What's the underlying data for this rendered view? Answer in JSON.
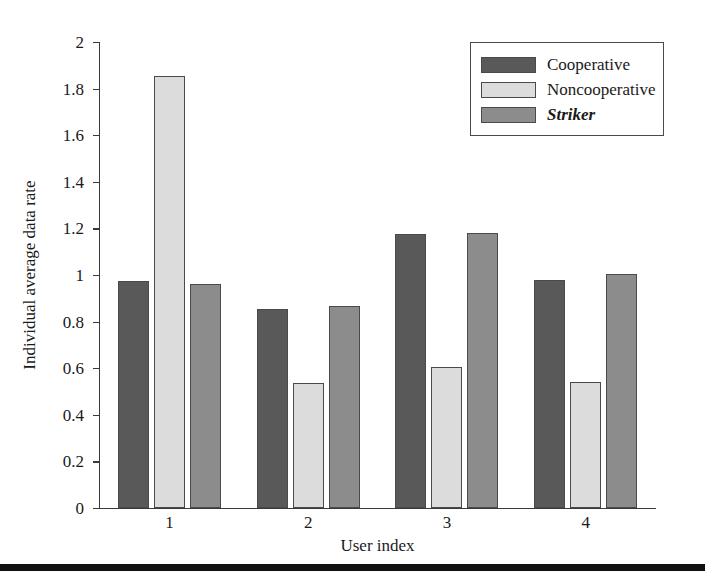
{
  "chart_data": {
    "type": "bar",
    "title": "",
    "xlabel": "User index",
    "ylabel": "Individual average data rate",
    "categories": [
      "1",
      "2",
      "3",
      "4"
    ],
    "ylim": [
      0,
      2
    ],
    "yticks": [
      "0",
      "0.2",
      "0.4",
      "0.6",
      "0.8",
      "1",
      "1.2",
      "1.4",
      "1.6",
      "1.8",
      "2"
    ],
    "ytick_values": [
      0,
      0.2,
      0.4,
      0.6,
      0.8,
      1,
      1.2,
      1.4,
      1.6,
      1.8,
      2
    ],
    "grid": false,
    "legend_position": "top-right",
    "series": [
      {
        "name": "Cooperative",
        "color": "#595959",
        "italic": false,
        "values": [
          0.975,
          0.855,
          1.175,
          0.98
        ]
      },
      {
        "name": "Noncooperative",
        "color": "#dcdcdc",
        "italic": false,
        "values": [
          1.855,
          0.535,
          0.605,
          0.54
        ]
      },
      {
        "name": "Striker",
        "color": "#8c8c8c",
        "italic": true,
        "values": [
          0.96,
          0.865,
          1.18,
          1.005
        ]
      }
    ]
  },
  "figure": {
    "axis_color": "#3a3a3a",
    "bar_edge_color": "#4a4a4a",
    "background": "#ffffff",
    "bottom_rule_color": "#111111"
  }
}
